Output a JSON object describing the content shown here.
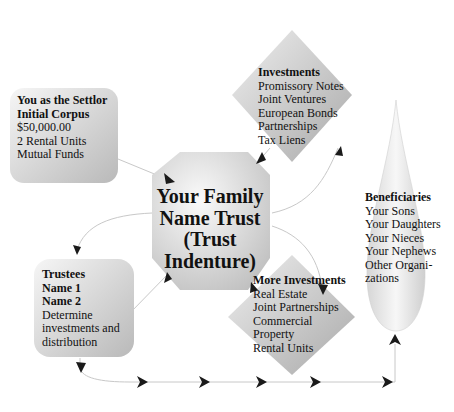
{
  "diagram": {
    "colors": {
      "shape_fill_light": "#f4f4f4",
      "shape_fill_dark": "#b8b8b8",
      "connector": "#c8c8c8",
      "arrowhead": "#1a1a1a",
      "text": "#111111"
    },
    "settlor": {
      "title": "You as the Settlor",
      "subtitle": "Initial Corpus",
      "items": [
        "$50,000.00",
        "2 Rental Units",
        "Mutual Funds"
      ]
    },
    "investments": {
      "title": "Investments",
      "items": [
        "Promissory Notes",
        "Joint Ventures",
        "European Bonds",
        "Partnerships",
        "Tax Liens"
      ]
    },
    "trust": {
      "lines": [
        "Your Family",
        "Name Trust",
        "(Trust",
        "Indenture)"
      ]
    },
    "trustees": {
      "title": "Trustees",
      "names": [
        "Name 1",
        "Name 2"
      ],
      "items": [
        "Determine",
        "investments and",
        "distribution"
      ]
    },
    "more_investments": {
      "title": "More Investments",
      "items": [
        "Real Estate",
        "Joint Partnerships",
        "Commercial",
        "Property",
        "Rental Units"
      ]
    },
    "beneficiaries": {
      "title": "Beneficiaries",
      "items": [
        "Your Sons",
        "Your Daughters",
        "Your Nieces",
        "Your Nephews",
        "Other Organi-",
        "zations"
      ]
    }
  }
}
